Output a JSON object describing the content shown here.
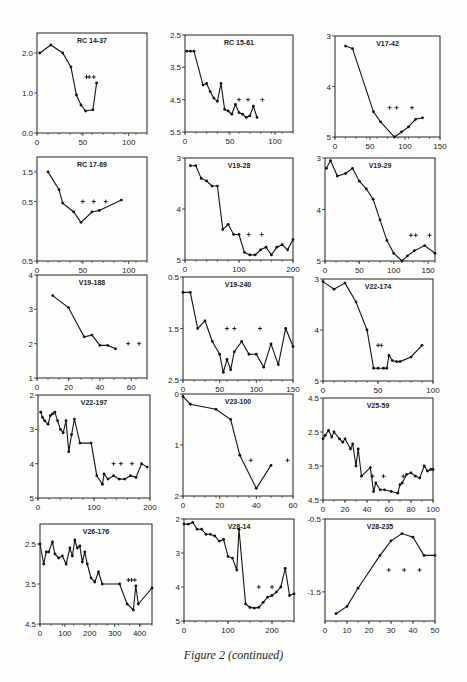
{
  "caption": "Figure 2 (continued)",
  "chart_data": [
    {
      "type": "line",
      "title": "RC 14-37",
      "xlim": [
        0,
        120
      ],
      "ylim": [
        0,
        2.5
      ],
      "yreverse": false,
      "xticks": [
        0,
        50,
        100
      ],
      "yticks": [
        0.0,
        1.0,
        2.0
      ],
      "yticklabels": [
        "0.0",
        "1.0",
        "2.0"
      ],
      "x": [
        3,
        15,
        28,
        37,
        42,
        47,
        53,
        58
      ],
      "y": [
        2.0,
        2.2,
        2.0,
        1.65,
        0.95,
        0.7,
        0.55,
        0.58,
        1.25
      ],
      "xs": [
        3,
        15,
        28,
        37,
        43,
        48,
        53,
        61,
        65
      ],
      "markers_plus": [
        [
          54,
          1.4
        ],
        [
          57,
          1.4
        ],
        [
          62,
          1.4
        ]
      ]
    },
    {
      "type": "line",
      "title": "RC 15-61",
      "xlim": [
        0,
        120
      ],
      "ylim": [
        2.5,
        5.5
      ],
      "yreverse": true,
      "xticks": [
        0,
        50,
        100
      ],
      "yticks": [
        2.5,
        3.5,
        4.5,
        5.5
      ],
      "yticklabels": [
        "2.5",
        "3.5",
        "4.5",
        "5.5"
      ],
      "xs": [
        2,
        6,
        10,
        20,
        24,
        28,
        32,
        36,
        40,
        44,
        48,
        52,
        56,
        60,
        64,
        68,
        72,
        76,
        80
      ],
      "y": [
        3.0,
        3.0,
        3.0,
        4.05,
        4.0,
        4.25,
        4.45,
        4.55,
        4.0,
        4.8,
        4.85,
        4.95,
        4.65,
        4.9,
        4.95,
        5.05,
        5.0,
        4.7,
        5.05
      ],
      "markers_plus": [
        [
          60,
          4.5
        ],
        [
          70,
          4.5
        ],
        [
          86,
          4.5
        ]
      ]
    },
    {
      "type": "line",
      "title": "V17-42",
      "xlim": [
        0,
        150
      ],
      "ylim": [
        3,
        5
      ],
      "yreverse": true,
      "xticks": [
        0,
        50,
        100,
        150
      ],
      "yticks": [
        3,
        4,
        5
      ],
      "yticklabels": [
        "3",
        "4",
        "5"
      ],
      "xs": [
        15,
        25,
        55,
        65,
        85,
        95,
        105,
        115,
        125
      ],
      "y": [
        3.2,
        3.25,
        4.5,
        4.7,
        5.0,
        4.9,
        4.8,
        4.65,
        4.62
      ],
      "markers_plus": [
        [
          78,
          4.42
        ],
        [
          88,
          4.42
        ],
        [
          110,
          4.42
        ]
      ]
    },
    {
      "type": "line",
      "title": "RC 17-69",
      "xlim": [
        0,
        120
      ],
      "ylim": [
        -1.5,
        2.0
      ],
      "yreverse": false,
      "xticks": [
        0,
        50,
        100
      ],
      "yticks": [
        -1.5,
        0.5,
        1.5
      ],
      "yticklabels": [
        "0.5",
        "0.5",
        "1.5"
      ],
      "xs": [
        12,
        24,
        28,
        40,
        48,
        60,
        68,
        92
      ],
      "y": [
        1.5,
        0.9,
        0.45,
        0.15,
        -0.2,
        0.15,
        0.2,
        0.55
      ],
      "markers_plus": [
        [
          50,
          0.5
        ],
        [
          62,
          0.5
        ],
        [
          75,
          0.5
        ]
      ]
    },
    {
      "type": "line",
      "title": "V19-28",
      "xlim": [
        0,
        200
      ],
      "ylim": [
        3,
        5
      ],
      "yreverse": true,
      "xticks": [
        0,
        100,
        200
      ],
      "yticks": [
        3,
        4,
        5
      ],
      "yticklabels": [
        "3",
        "4",
        "5"
      ],
      "xs": [
        10,
        20,
        30,
        40,
        50,
        60,
        70,
        80,
        90,
        100,
        110,
        120,
        130,
        140,
        150,
        160,
        170,
        180,
        190,
        200
      ],
      "y": [
        3.15,
        3.15,
        3.4,
        3.45,
        3.55,
        3.55,
        4.4,
        4.3,
        4.5,
        4.5,
        4.85,
        4.9,
        4.9,
        4.8,
        4.75,
        4.9,
        4.75,
        4.7,
        4.8,
        4.6
      ],
      "markers_plus": [
        [
          118,
          4.5
        ],
        [
          142,
          4.5
        ]
      ]
    },
    {
      "type": "line",
      "title": "V19-29",
      "xlim": [
        0,
        160
      ],
      "ylim": [
        3,
        5
      ],
      "yreverse": true,
      "xticks": [
        0,
        50,
        100,
        150
      ],
      "yticks": [
        3,
        4,
        5
      ],
      "yticklabels": [
        "3",
        "4",
        "5"
      ],
      "xs": [
        2,
        8,
        18,
        30,
        40,
        50,
        60,
        70,
        80,
        90,
        100,
        112,
        120,
        130,
        145,
        160
      ],
      "y": [
        3.2,
        3.05,
        3.35,
        3.3,
        3.2,
        3.45,
        3.6,
        3.8,
        4.2,
        4.6,
        4.85,
        5.0,
        4.9,
        4.8,
        4.7,
        4.85
      ],
      "markers_plus": [
        [
          125,
          4.5
        ],
        [
          132,
          4.5
        ],
        [
          152,
          4.5
        ]
      ]
    },
    {
      "type": "line",
      "title": "V19-188",
      "xlim": [
        0,
        70
      ],
      "ylim": [
        1,
        4
      ],
      "yreverse": false,
      "xticks": [
        0,
        20,
        40,
        60
      ],
      "yticks": [
        1,
        2,
        3,
        4
      ],
      "yticklabels": [
        "1",
        "2",
        "3",
        "4"
      ],
      "xs": [
        10,
        20,
        30,
        35,
        40,
        45,
        50
      ],
      "y": [
        3.4,
        3.05,
        2.2,
        2.25,
        1.95,
        1.95,
        1.85
      ],
      "markers_plus": [
        [
          58,
          2.0
        ],
        [
          65,
          2.0
        ]
      ]
    },
    {
      "type": "line",
      "title": "V19-240",
      "xlim": [
        0,
        150
      ],
      "ylim": [
        0.5,
        2.5
      ],
      "yreverse": true,
      "xticks": [
        0,
        50,
        100,
        150
      ],
      "yticks": [
        0.5,
        1.5,
        2.5
      ],
      "yticklabels": [
        "0.5",
        "1.5",
        "2.5"
      ],
      "xs": [
        0,
        10,
        20,
        30,
        40,
        50,
        55,
        60,
        65,
        70,
        80,
        90,
        100,
        110,
        120,
        130,
        140,
        150
      ],
      "y": [
        0.8,
        0.8,
        1.5,
        1.35,
        1.75,
        2.0,
        2.35,
        2.1,
        2.3,
        1.95,
        1.75,
        2.0,
        2.0,
        2.25,
        1.8,
        2.2,
        1.5,
        1.85
      ],
      "markers_plus": [
        [
          60,
          1.5
        ],
        [
          70,
          1.5
        ],
        [
          105,
          1.5
        ]
      ]
    },
    {
      "type": "line",
      "title": "V22-174",
      "xlim": [
        0,
        100
      ],
      "ylim": [
        3,
        5
      ],
      "yreverse": true,
      "xticks": [
        0,
        50,
        100
      ],
      "yticks": [
        3,
        4,
        5
      ],
      "yticklabels": [
        "3",
        "4",
        "5"
      ],
      "xs": [
        0,
        10,
        20,
        30,
        40,
        46,
        50,
        55,
        58,
        60,
        63,
        67,
        70,
        80,
        90
      ],
      "y": [
        3.05,
        3.2,
        3.08,
        3.45,
        4.0,
        4.75,
        4.75,
        4.75,
        4.75,
        4.5,
        4.6,
        4.62,
        4.62,
        4.53,
        4.3
      ],
      "markers_plus": [
        [
          50,
          4.3
        ],
        [
          53,
          4.3
        ]
      ]
    },
    {
      "type": "line",
      "title": "V22-197",
      "xlim": [
        0,
        200
      ],
      "ylim": [
        2,
        5
      ],
      "yreverse": true,
      "xticks": [
        0,
        100,
        200
      ],
      "yticks": [
        2,
        3,
        4,
        5
      ],
      "yticklabels": [
        "2",
        "3",
        "4",
        "5"
      ],
      "xs": [
        5,
        8,
        12,
        18,
        22,
        26,
        30,
        35,
        40,
        45,
        50,
        55,
        60,
        65,
        75,
        95,
        105,
        115,
        118,
        125,
        135,
        145,
        155,
        165,
        175,
        185,
        195
      ],
      "y": [
        2.5,
        2.65,
        2.75,
        2.85,
        2.6,
        2.55,
        2.5,
        2.75,
        3.0,
        3.1,
        2.75,
        3.65,
        3.15,
        2.7,
        3.4,
        3.4,
        4.35,
        4.6,
        4.3,
        4.45,
        4.35,
        4.45,
        4.45,
        4.35,
        4.4,
        4.0,
        4.1
      ],
      "markers_plus": [
        [
          135,
          4.0
        ],
        [
          148,
          4.0
        ],
        [
          168,
          4.0
        ]
      ]
    },
    {
      "type": "line",
      "title": "V23-100",
      "xlim": [
        0,
        60
      ],
      "ylim": [
        0,
        2
      ],
      "yreverse": true,
      "xticks": [
        0,
        20,
        40,
        60
      ],
      "yticks": [
        0,
        1,
        2
      ],
      "yticklabels": [
        "0",
        "1",
        "2"
      ],
      "xs": [
        0,
        4,
        18,
        26,
        31,
        40,
        48
      ],
      "y": [
        0.05,
        0.2,
        0.3,
        0.5,
        1.2,
        1.85,
        1.4
      ],
      "markers_plus": [
        [
          37,
          1.3
        ],
        [
          57,
          1.3
        ]
      ]
    },
    {
      "type": "line",
      "title": "V25-59",
      "xlim": [
        0,
        100
      ],
      "ylim": [
        1.5,
        4.5
      ],
      "yreverse": true,
      "xticks": [
        0,
        20,
        40,
        60,
        80,
        100
      ],
      "yticks": [
        1.5,
        2.5,
        3.5,
        4.5
      ],
      "yticklabels": [
        "4.5",
        "2.5",
        "3.5",
        "4.5"
      ],
      "xs": [
        0,
        2,
        5,
        8,
        10,
        15,
        18,
        20,
        25,
        27,
        30,
        32,
        35,
        43,
        46,
        48,
        52,
        56,
        62,
        68,
        70,
        72,
        76,
        80,
        84,
        88,
        92,
        95,
        98,
        100
      ],
      "y": [
        2.7,
        2.6,
        2.45,
        2.65,
        2.5,
        2.7,
        2.8,
        2.7,
        3.0,
        2.85,
        3.5,
        3.0,
        3.8,
        3.55,
        4.25,
        4.0,
        4.2,
        4.2,
        4.25,
        4.3,
        4.05,
        4.0,
        3.75,
        3.7,
        3.8,
        3.85,
        3.5,
        3.65,
        3.6,
        3.6
      ],
      "markers_plus": [
        [
          45,
          3.8
        ],
        [
          55,
          3.8
        ],
        [
          73,
          3.8
        ]
      ]
    },
    {
      "type": "line",
      "title": "V26-176",
      "xlim": [
        0,
        450
      ],
      "ylim": [
        2.0,
        4.5
      ],
      "yreverse": true,
      "xticks": [
        0,
        100,
        200,
        300,
        400
      ],
      "yticks": [
        2.5,
        3.5,
        4.5
      ],
      "yticklabels": [
        "2.5",
        "3.5",
        "4.5"
      ],
      "xs": [
        0,
        15,
        25,
        35,
        50,
        60,
        75,
        90,
        105,
        120,
        130,
        140,
        150,
        160,
        170,
        180,
        190,
        205,
        220,
        235,
        250,
        320,
        350,
        375,
        385,
        395,
        450
      ],
      "y": [
        2.5,
        3.0,
        2.7,
        2.7,
        2.45,
        2.75,
        2.85,
        2.8,
        3.0,
        2.6,
        2.8,
        2.4,
        2.6,
        2.55,
        2.95,
        2.7,
        3.0,
        3.35,
        3.45,
        3.2,
        3.5,
        3.5,
        4.0,
        4.15,
        3.55,
        4.0,
        3.6
      ],
      "markers_plus": [
        [
          355,
          3.4
        ],
        [
          368,
          3.4
        ],
        [
          381,
          3.4
        ]
      ]
    },
    {
      "type": "line",
      "title": "V28-14",
      "xlim": [
        0,
        250
      ],
      "ylim": [
        2,
        5
      ],
      "yreverse": true,
      "xticks": [
        0,
        100,
        200
      ],
      "yticks": [
        2,
        3,
        4,
        5
      ],
      "yticklabels": [
        "2",
        "3",
        "4",
        "5"
      ],
      "xs": [
        0,
        10,
        20,
        30,
        40,
        50,
        60,
        70,
        80,
        90,
        100,
        110,
        120,
        125,
        140,
        150,
        160,
        170,
        180,
        190,
        200,
        210,
        220,
        230,
        240,
        250
      ],
      "y": [
        2.15,
        2.15,
        2.1,
        2.3,
        2.3,
        2.45,
        2.45,
        2.5,
        2.65,
        2.6,
        3.1,
        3.15,
        3.5,
        2.3,
        4.5,
        4.6,
        4.62,
        4.6,
        4.45,
        4.3,
        4.25,
        4.15,
        4.0,
        3.45,
        4.25,
        4.2
      ],
      "markers_plus": [
        [
          170,
          4.0
        ],
        [
          200,
          4.0
        ]
      ]
    },
    {
      "type": "line",
      "title": "V28-235",
      "xlim": [
        0,
        50
      ],
      "ylim": [
        -1.9,
        -0.5
      ],
      "yreverse": false,
      "xticks": [
        0,
        10,
        20,
        30,
        40,
        50
      ],
      "yticks": [
        -1.5,
        -0.5
      ],
      "yticklabels": [
        "-1.5",
        "-0.5"
      ],
      "xs": [
        5,
        10,
        15,
        25,
        30,
        35,
        40,
        45,
        50
      ],
      "y": [
        -1.8,
        -1.7,
        -1.45,
        -1.0,
        -0.8,
        -0.7,
        -0.75,
        -1.0,
        -1.0
      ],
      "markers_plus": [
        [
          29,
          -1.2
        ],
        [
          36,
          -1.2
        ],
        [
          43,
          -1.2
        ]
      ]
    }
  ]
}
